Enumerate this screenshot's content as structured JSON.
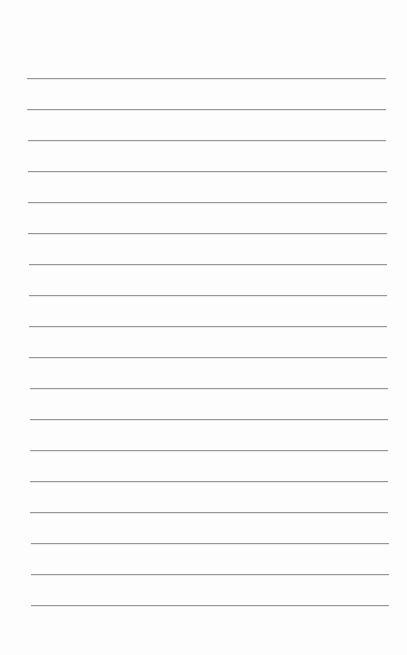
{
  "document": {
    "type": "ruled-paper",
    "background_color": "#fdfdfd",
    "line_color": "#8c8c8c",
    "line_count": 18,
    "line_spacing_px": 31,
    "lines": [
      {
        "y": 78,
        "x1": 27,
        "x2": 386
      },
      {
        "y": 109,
        "x1": 27,
        "x2": 386
      },
      {
        "y": 140,
        "x1": 28,
        "x2": 386
      },
      {
        "y": 171,
        "x1": 28,
        "x2": 387
      },
      {
        "y": 202,
        "x1": 28,
        "x2": 387
      },
      {
        "y": 233,
        "x1": 28,
        "x2": 387
      },
      {
        "y": 264,
        "x1": 29,
        "x2": 387
      },
      {
        "y": 295,
        "x1": 29,
        "x2": 387
      },
      {
        "y": 326,
        "x1": 29,
        "x2": 387
      },
      {
        "y": 357,
        "x1": 29,
        "x2": 387
      },
      {
        "y": 388,
        "x1": 30,
        "x2": 388
      },
      {
        "y": 419,
        "x1": 30,
        "x2": 388
      },
      {
        "y": 450,
        "x1": 30,
        "x2": 388
      },
      {
        "y": 481,
        "x1": 30,
        "x2": 388
      },
      {
        "y": 512,
        "x1": 30,
        "x2": 388
      },
      {
        "y": 543,
        "x1": 31,
        "x2": 389
      },
      {
        "y": 574,
        "x1": 31,
        "x2": 389
      },
      {
        "y": 605,
        "x1": 31,
        "x2": 389
      }
    ],
    "text_content": []
  }
}
